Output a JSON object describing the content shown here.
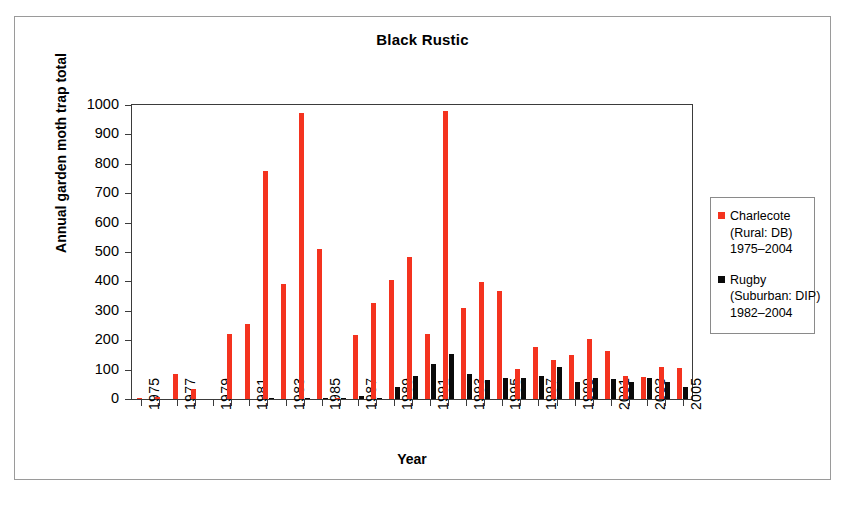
{
  "figure": {
    "title": "Black Rustic",
    "xlabel": "Year",
    "ylabel": "Annual garden moth trap total"
  },
  "legend": {
    "position": "right",
    "entries": [
      {
        "name": "Charlecote",
        "swatch_color": "#f4331f",
        "sub1": "(Rural: DB)",
        "sub2": "1975–2004"
      },
      {
        "name": "Rugby",
        "swatch_color": "#0a0a0a",
        "sub1": "(Suburban: DIP)",
        "sub2": "1982–2004"
      }
    ]
  },
  "chart_data": {
    "type": "bar",
    "title": "Black Rustic",
    "xlabel": "Year",
    "ylabel": "Annual garden moth trap total",
    "ylim": [
      0,
      1000
    ],
    "ytick_labels": [
      "0",
      "100",
      "200",
      "300",
      "400",
      "500",
      "600",
      "700",
      "800",
      "900",
      "1000"
    ],
    "ytick_values": [
      0,
      100,
      200,
      300,
      400,
      500,
      600,
      700,
      800,
      900,
      1000
    ],
    "grid": false,
    "legend_position": "right",
    "xtick_labels": [
      "1975",
      "1977",
      "1979",
      "1981",
      "1983",
      "1985",
      "1987",
      "1989",
      "1991",
      "1993",
      "1995",
      "1997",
      "1999",
      "2001",
      "2003",
      "2005"
    ],
    "categories": [
      1975,
      1976,
      1977,
      1978,
      1979,
      1980,
      1981,
      1982,
      1983,
      1984,
      1985,
      1986,
      1987,
      1988,
      1989,
      1990,
      1991,
      1992,
      1993,
      1994,
      1995,
      1996,
      1997,
      1998,
      1999,
      2000,
      2001,
      2002,
      2003,
      2004,
      2005
    ],
    "series": [
      {
        "name": "Charlecote",
        "color": "#f4331f",
        "values": [
          2,
          6,
          85,
          35,
          0,
          220,
          255,
          775,
          392,
          972,
          510,
          5,
          218,
          325,
          405,
          482,
          220,
          978,
          310,
          398,
          368,
          103,
          178,
          132,
          150,
          205,
          162,
          78,
          75,
          110,
          105
        ]
      },
      {
        "name": "Rugby",
        "color": "#0a0a0a",
        "values": [
          0,
          0,
          0,
          0,
          0,
          0,
          0,
          2,
          0,
          3,
          5,
          2,
          10,
          3,
          42,
          78,
          120,
          152,
          85,
          65,
          70,
          70,
          77,
          108,
          57,
          70,
          68,
          58,
          70,
          58,
          42
        ]
      }
    ]
  }
}
